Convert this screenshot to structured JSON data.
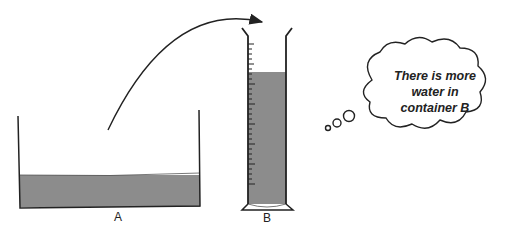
{
  "diagram": {
    "container_a": {
      "label": "A",
      "fill_color": "#8c8c8c"
    },
    "container_b": {
      "label": "B",
      "fill_color": "#8c8c8c"
    },
    "arrow": {
      "from": "container_a",
      "to": "container_b"
    },
    "thought_bubble": {
      "lines": [
        "There is more",
        "water in",
        "container B"
      ]
    },
    "colors": {
      "water": "#8c8c8c",
      "outline": "#222222"
    }
  }
}
